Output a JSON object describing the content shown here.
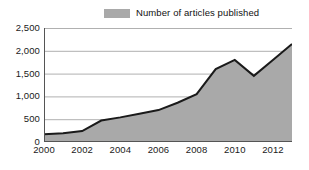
{
  "legend": {
    "label": "Number of articles published",
    "swatch_color": "#a9a9a9",
    "position": "top-center"
  },
  "colors": {
    "area_fill": "#a9a9a9",
    "line": "#1a1a1a",
    "gridline": "#b0b0b0",
    "axis": "#555555",
    "text": "#1a1a1a",
    "background": "#ffffff"
  },
  "axis": {
    "y_ticks": [
      "0",
      "500",
      "1,000",
      "1,500",
      "2,000",
      "2,500"
    ],
    "x_ticks": [
      "2000",
      "2002",
      "2004",
      "2006",
      "2008",
      "2010",
      "2012"
    ],
    "y_min": 0,
    "y_max": 2500,
    "x_min": 2000,
    "x_max": 2013
  },
  "chart_data": {
    "type": "area",
    "title": "",
    "subtitle": "",
    "xlabel": "",
    "ylabel": "",
    "xlim": [
      2000,
      2013
    ],
    "ylim": [
      0,
      2500
    ],
    "grid": true,
    "legend_position": "top-center",
    "categories": [
      2000,
      2001,
      2002,
      2003,
      2004,
      2005,
      2006,
      2007,
      2008,
      2009,
      2010,
      2011,
      2012,
      2013
    ],
    "series": [
      {
        "name": "Number of articles published",
        "color": "#a9a9a9",
        "values": [
          170,
          190,
          240,
          470,
          540,
          620,
          700,
          860,
          1050,
          1600,
          1800,
          1450,
          1800,
          2150
        ]
      }
    ],
    "x_tick_values": [
      2000,
      2002,
      2004,
      2006,
      2008,
      2010,
      2012
    ],
    "x_minor_tick_values": [
      2001,
      2003,
      2005,
      2007,
      2009,
      2011,
      2013
    ],
    "y_tick_values": [
      0,
      500,
      1000,
      1500,
      2000,
      2500
    ],
    "annotations": []
  }
}
